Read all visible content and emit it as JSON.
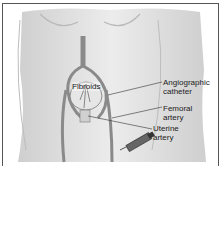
{
  "diagram": {
    "labels": [
      {
        "id": "fibroids",
        "text": "Fibroids"
      },
      {
        "id": "angiographic-catheter",
        "text": "Angiographic\ncatheter"
      },
      {
        "id": "femoral-artery",
        "text": "Femoral\nartery"
      },
      {
        "id": "uterine-artery",
        "text": "Uterine\nartery"
      }
    ]
  },
  "colors": {
    "frame": "#555555",
    "skin": "#dcdcdc",
    "vessel": "#8a8a8a",
    "outline": "#6a6a6a"
  }
}
